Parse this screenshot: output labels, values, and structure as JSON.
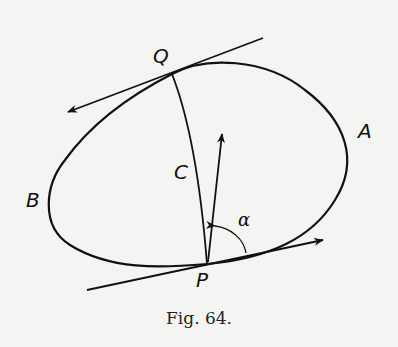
{
  "figure": {
    "caption": "Fig. 64.",
    "labels": {
      "Q": "Q",
      "A": "A",
      "B": "B",
      "C": "C",
      "P": "P",
      "alpha": "α"
    },
    "elements": [
      "closed oval curve through A and B",
      "point Q on top of curve with tangent arrow pointing left",
      "point P on bottom of curve with tangent arrow pointing right",
      "curve C joining Q and P",
      "vector from P pointing up",
      "angle α between tangent at P and the upward vector"
    ],
    "stroke_color": "#111111",
    "background_color": "#f4f4f2"
  }
}
